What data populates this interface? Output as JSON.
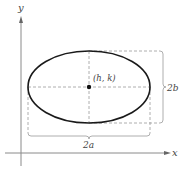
{
  "diagram": {
    "type": "ellipse-with-horizontal-major-axis",
    "axes": {
      "x_label": "x",
      "y_label": "y"
    },
    "center_label": "(h, k)",
    "major_axis_label": "2a",
    "minor_axis_label": "2b",
    "colors": {
      "ellipse": "#1a1a1a",
      "axes": "#888888",
      "dashed": "#999999",
      "text": "#444444"
    }
  }
}
